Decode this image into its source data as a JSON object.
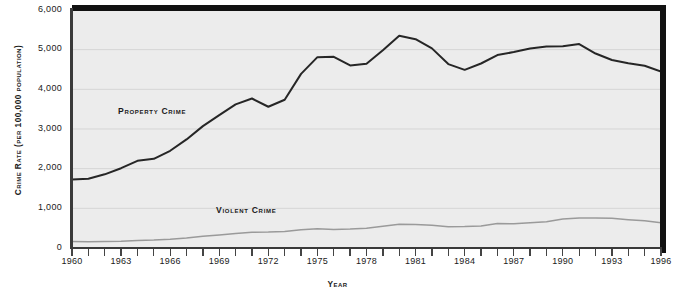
{
  "chart_data": {
    "type": "line",
    "title": "",
    "xlabel": "Year",
    "ylabel": "Crime Rate (per 100,000 population)",
    "ylim": [
      0,
      6000
    ],
    "xlim": [
      1960,
      1996
    ],
    "yticks": [
      0,
      1000,
      2000,
      3000,
      4000,
      5000,
      6000
    ],
    "ytick_labels": [
      "0",
      "1,000",
      "2,000",
      "3,000",
      "4,000",
      "5,000",
      "6,000"
    ],
    "xticks": [
      1960,
      1963,
      1966,
      1969,
      1972,
      1975,
      1978,
      1981,
      1984,
      1987,
      1990,
      1993,
      1996
    ],
    "xtick_labels": [
      "1960",
      "1963",
      "1966",
      "1969",
      "1972",
      "1975",
      "1978",
      "1981",
      "1984",
      "1987",
      "1990",
      "1993",
      "1996"
    ],
    "x_minor_ticks_every": 1,
    "grid": "horizontal",
    "legend_position": "inline-annotations",
    "x": [
      1960,
      1961,
      1962,
      1963,
      1964,
      1965,
      1966,
      1967,
      1968,
      1969,
      1970,
      1971,
      1972,
      1973,
      1974,
      1975,
      1976,
      1977,
      1978,
      1979,
      1980,
      1981,
      1982,
      1983,
      1984,
      1985,
      1986,
      1987,
      1988,
      1989,
      1990,
      1991,
      1992,
      1993,
      1994,
      1995,
      1996
    ],
    "series": [
      {
        "name": "Property Crime",
        "color": "#262626",
        "values": [
          1726,
          1747,
          1857,
          2012,
          2198,
          2249,
          2451,
          2737,
          3072,
          3351,
          3621,
          3769,
          3561,
          3737,
          4389,
          4811,
          4820,
          4602,
          4643,
          4986,
          5353,
          5264,
          5033,
          4637,
          4492,
          4651,
          4863,
          4940,
          5027,
          5078,
          5089,
          5140,
          4903,
          4740,
          4660,
          4593,
          4445
        ]
      },
      {
        "name": "Violent Crime",
        "color": "#9a9a9a",
        "values": [
          161,
          158,
          162,
          168,
          191,
          200,
          220,
          253,
          298,
          329,
          364,
          396,
          401,
          417,
          461,
          488,
          468,
          476,
          498,
          549,
          597,
          594,
          571,
          538,
          539,
          557,
          620,
          610,
          637,
          663,
          730,
          758,
          758,
          747,
          714,
          685,
          637
        ]
      }
    ],
    "annotations": [
      {
        "text": "Property Crime",
        "x": 1964,
        "y": 3200
      },
      {
        "text": "Violent Crime",
        "x": 1970,
        "y": 850
      }
    ]
  },
  "axes": {
    "ylabel_text": "Crime Rate (per 100,000 population)",
    "xlabel_text": "Year"
  },
  "colors": {
    "plot_background": "#ececec",
    "page_background": "#ffffff",
    "border": "#111111",
    "axis": "#3a3a3a",
    "gridline": "#d5d5d5",
    "property_crime": "#262626",
    "violent_crime": "#9a9a9a",
    "text": "#1a1a1a"
  }
}
